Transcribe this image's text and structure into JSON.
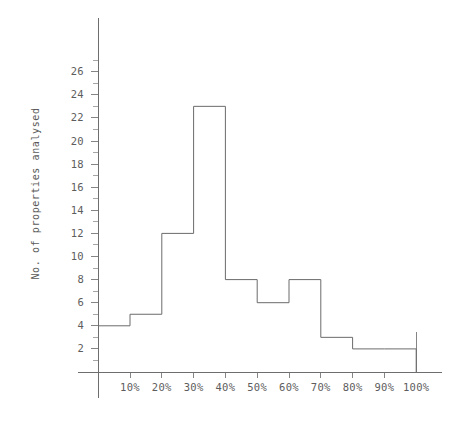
{
  "chart_data": {
    "type": "bar",
    "title": "",
    "subtitle": "",
    "xlabel": "",
    "ylabel": "No. of properties analysed",
    "categories": [
      "0-10%",
      "10-20%",
      "20-30%",
      "30-40%",
      "40-50%",
      "50-60%",
      "60-70%",
      "70-80%",
      "80-90%",
      "90-100%"
    ],
    "values": [
      4,
      5,
      12,
      23,
      8,
      6,
      8,
      3,
      2,
      2
    ],
    "bin_edges": [
      0,
      10,
      20,
      30,
      40,
      50,
      60,
      70,
      80,
      90,
      100
    ],
    "x_tick_labels": [
      "10%",
      "20%",
      "30%",
      "40%",
      "50%",
      "60%",
      "70%",
      "80%",
      "90%",
      "100%"
    ],
    "x_tick_values": [
      10,
      20,
      30,
      40,
      50,
      60,
      70,
      80,
      90,
      100
    ],
    "y_tick_labels": [
      "2",
      "4",
      "6",
      "8",
      "10",
      "12",
      "14",
      "16",
      "18",
      "20",
      "22",
      "24",
      "26"
    ],
    "y_tick_values": [
      2,
      4,
      6,
      8,
      10,
      12,
      14,
      16,
      18,
      20,
      22,
      24,
      26
    ],
    "y_minor_tick_values": [
      1,
      3,
      5,
      7,
      9,
      11,
      13,
      15,
      17,
      19,
      21,
      23,
      25,
      27
    ],
    "xlim": [
      0,
      100
    ],
    "ylim": [
      0,
      27
    ],
    "grid": false,
    "legend": null,
    "legend_position": "none",
    "annotations": [],
    "colors": {
      "line": "#6b6b6b",
      "axis": "#6e6e6e",
      "tick": "#858585",
      "text": "#5d5d5d",
      "background": "#ffffff"
    },
    "style": "outline-step-histogram"
  }
}
